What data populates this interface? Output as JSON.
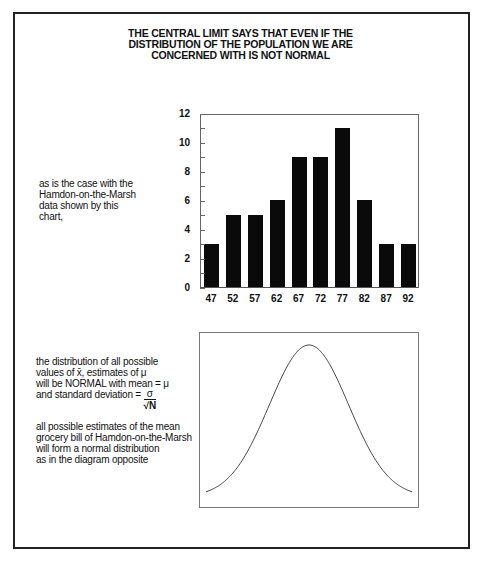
{
  "title": {
    "lines": [
      "THE CENTRAL LIMIT SAYS THAT EVEN IF THE",
      "DISTRIBUTION OF THE POPULATION WE ARE",
      "CONCERNED WITH IS NOT NORMAL"
    ]
  },
  "note_top": {
    "lines": [
      "as is the case with the",
      "Hamdon-on-the-Marsh",
      "data shown by this",
      "chart,"
    ]
  },
  "note_bottom": {
    "lines": [
      "the distribution of all possible",
      "values of x̄, estimates of μ",
      "will be NORMAL with mean = μ",
      "and standard deviation ="
    ],
    "fraction_numerator": "σ",
    "fraction_denominator": "√N"
  },
  "note_conclusion": {
    "lines": [
      "all possible estimates of the mean",
      "grocery bill of Hamdon-on-the-Marsh",
      "will form a normal distribution",
      "as in the diagram opposite"
    ]
  },
  "chart_data": [
    {
      "type": "bar",
      "title": "",
      "xlabel": "",
      "ylabel": "",
      "categories": [
        "47",
        "52",
        "57",
        "62",
        "67",
        "72",
        "77",
        "82",
        "87",
        "92"
      ],
      "values": [
        3,
        5,
        5,
        6,
        9,
        9,
        11,
        6,
        3,
        3
      ],
      "ylim": [
        0,
        12
      ],
      "yticks": [
        "0",
        "2",
        "4",
        "6",
        "8",
        "10",
        "12"
      ],
      "minor_ticks_every": 1,
      "grid": false,
      "bar_color": "#0a0a0a"
    },
    {
      "type": "line",
      "title": "",
      "description": "Normal distribution bell curve (no axis labels)",
      "xlabel": "",
      "ylabel": "",
      "grid": false,
      "line_color": "#444444"
    }
  ]
}
